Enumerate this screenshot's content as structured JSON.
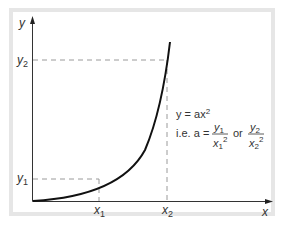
{
  "diagram": {
    "axes": {
      "x_label": "x",
      "y_label": "y"
    },
    "points": {
      "x1": "x",
      "x1_sub": "1",
      "x2": "x",
      "x2_sub": "2",
      "y1": "y",
      "y1_sub": "1",
      "y2": "y",
      "y2_sub": "2"
    },
    "equation": {
      "line1_prefix": "y = ax",
      "line1_exp": "2",
      "line2_prefix": "i.e. a = ",
      "frac1_num": "y",
      "frac1_num_sub": "1",
      "frac1_den": "x",
      "frac1_den_sub": "1",
      "frac1_den_exp": "2",
      "or": "or",
      "frac2_num": "y",
      "frac2_num_sub": "2",
      "frac2_den": "x",
      "frac2_den_sub": "2",
      "frac2_den_exp": "2"
    },
    "colors": {
      "frame": "#e6e6e6",
      "axis": "#333333",
      "curve": "#111111",
      "dashed": "#999999"
    }
  }
}
